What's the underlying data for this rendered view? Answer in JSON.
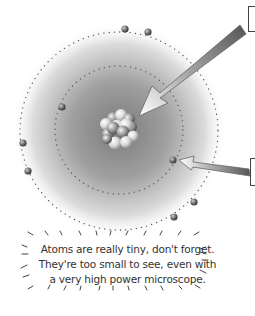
{
  "diagram": {
    "parts": [
      {
        "id": "nucleus",
        "label": ""
      },
      {
        "id": "electron",
        "label": ""
      }
    ],
    "colors": {
      "cloud_center": "#8a8a8a",
      "cloud_edge": "#ffffff",
      "orbit_dots": "#555555",
      "arrow_dark": "#6f6f6f",
      "arrow_light": "#f2f2f2"
    }
  },
  "caption": {
    "lines": [
      "Atoms are really tiny, don't forget.",
      "They're too small to see, even with",
      "a very high power microscope."
    ]
  }
}
